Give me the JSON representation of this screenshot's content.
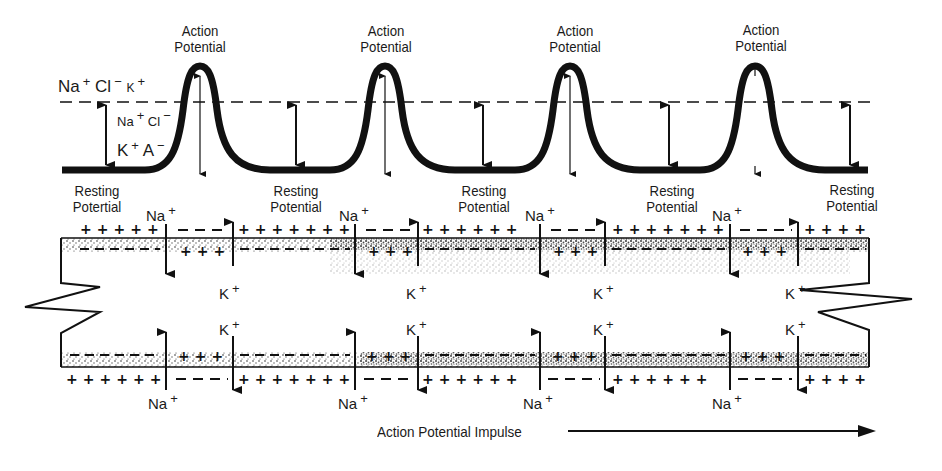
{
  "diagram": {
    "waveform": {
      "peak_label_line1": "Action",
      "peak_label_line2": "Potential",
      "peaks": [
        {
          "label": [
            "Action",
            "Potential"
          ]
        },
        {
          "label": [
            "Action",
            "Potential"
          ]
        },
        {
          "label": [
            "Action",
            "Potential"
          ]
        },
        {
          "label": [
            "Action",
            "Potential"
          ]
        }
      ],
      "ion_labels": {
        "outside": {
          "na": "Na",
          "na_charge": "+",
          "cl": "Cl",
          "cl_charge": "−",
          "k": "K",
          "k_charge": "+"
        },
        "inside_upper": {
          "na": "Na",
          "na_charge": "+",
          "cl": "Cl",
          "cl_charge": "−"
        },
        "inside_lower": {
          "k": "K",
          "k_charge": "+",
          "a": "A",
          "a_charge": "−"
        }
      }
    },
    "resting_labels": [
      {
        "line1": "Resting",
        "line2": "Potertial"
      },
      {
        "line1": "Resting",
        "line2": "Potential"
      },
      {
        "line1": "Resting",
        "line2": "Potential"
      },
      {
        "line1": "Resting",
        "line2": "Potential"
      },
      {
        "line1": "Resting",
        "line2": "Potential"
      }
    ],
    "axon": {
      "na_label": "Na",
      "k_label": "K",
      "charge_plus": "+",
      "top_sodium_channels": 4,
      "top_potassium_channels": 4,
      "bottom_sodium_channels": 4,
      "bottom_potassium_channels": 4
    },
    "footer": {
      "impulse_label": "Action Potential Impulse",
      "direction": "right"
    }
  },
  "colors": {
    "ink": "#111111",
    "background": "#ffffff",
    "stipple": "#2a2a2a"
  }
}
